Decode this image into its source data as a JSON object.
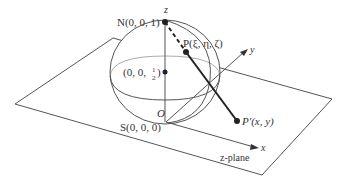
{
  "figure": {
    "labels": {
      "north": "N(0, 0, 1)",
      "center": "(0, 0, ",
      "center_frac_num": "1",
      "center_frac_den": "2",
      "center_close": ")",
      "point_p": "P(ξ, η, ζ)",
      "point_p_prime": "P′(x, y)",
      "south": "S(0, 0, 0)",
      "origin": "O",
      "axis_x": "x",
      "axis_y": "y",
      "axis_z": "z",
      "plane": "z-plane"
    },
    "colors": {
      "line": "#555555",
      "thick": "#222222",
      "text": "#333333"
    }
  }
}
